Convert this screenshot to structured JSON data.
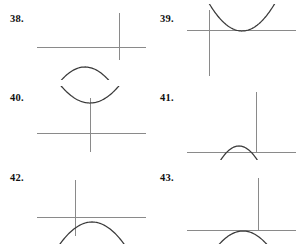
{
  "page": {
    "kind": "exercise-set",
    "width": 300,
    "height": 246,
    "background_color": "#ffffff",
    "axis_color": "#8a8a8a",
    "curve_color": "#3a3a3a",
    "label_color": "#111111"
  },
  "problems": [
    {
      "label": "38.",
      "label_x": 10,
      "label_y": 13,
      "panel_x": 33,
      "panel_y": 4,
      "panel_w": 115,
      "panel_h": 76,
      "axes": {
        "h_axis": {
          "x1": 4,
          "y": 43,
          "x2": 113
        },
        "v_axis": {
          "x": 86,
          "y1": 9,
          "y2": 56
        }
      },
      "curve": {
        "orientation": "opens-up",
        "vertex_x": 52,
        "vertex_y": 63,
        "a": 0.0235,
        "x_start": 8,
        "x_end": 110,
        "vertex_relative_to_origin": "below-and-left"
      }
    },
    {
      "label": "39.",
      "label_x": 160,
      "label_y": 13,
      "panel_x": 183,
      "panel_y": 4,
      "panel_w": 115,
      "panel_h": 76,
      "axes": {
        "h_axis": {
          "x1": 4,
          "y": 26,
          "x2": 113
        },
        "v_axis": {
          "x": 26,
          "y1": 6,
          "y2": 72
        }
      },
      "curve": {
        "orientation": "opens-down",
        "vertex_x": 59,
        "vertex_y": 27,
        "a": -0.0255,
        "x_start": 23,
        "x_end": 96,
        "vertex_relative_to_origin": "on-axis-right"
      }
    },
    {
      "label": "40.",
      "label_x": 10,
      "label_y": 92,
      "panel_x": 33,
      "panel_y": 86,
      "panel_w": 115,
      "panel_h": 74,
      "axes": {
        "h_axis": {
          "x1": 4,
          "y": 47,
          "x2": 113
        },
        "v_axis": {
          "x": 57,
          "y1": 12,
          "y2": 66
        }
      },
      "curve": {
        "orientation": "opens-down",
        "vertex_x": 57,
        "vertex_y": 17,
        "a": -0.0205,
        "x_start": 19,
        "x_end": 96,
        "vertex_relative_to_origin": "above-on-axis"
      }
    },
    {
      "label": "41.",
      "label_x": 160,
      "label_y": 92,
      "panel_x": 183,
      "panel_y": 86,
      "panel_w": 115,
      "panel_h": 74,
      "axes": {
        "h_axis": {
          "x1": 4,
          "y": 66,
          "x2": 113
        },
        "v_axis": {
          "x": 73,
          "y1": 6,
          "y2": 66
        }
      },
      "curve": {
        "orientation": "opens-up",
        "vertex_x": 56,
        "vertex_y": 60,
        "a": 0.042,
        "x_start": 22,
        "x_end": 90,
        "vertex_relative_to_origin": "above-axis-left"
      }
    },
    {
      "label": "42.",
      "label_x": 10,
      "label_y": 172,
      "panel_x": 33,
      "panel_y": 166,
      "panel_w": 115,
      "panel_h": 78,
      "axes": {
        "h_axis": {
          "x1": 4,
          "y": 51,
          "x2": 113
        },
        "v_axis": {
          "x": 42,
          "y1": 14,
          "y2": 70
        }
      },
      "curve": {
        "orientation": "opens-up",
        "vertex_x": 59,
        "vertex_y": 56,
        "a": 0.0215,
        "x_start": 8,
        "x_end": 110,
        "vertex_relative_to_origin": "below-and-right"
      }
    },
    {
      "label": "43.",
      "label_x": 160,
      "label_y": 172,
      "panel_x": 183,
      "panel_y": 166,
      "panel_w": 115,
      "panel_h": 78,
      "axes": {
        "h_axis": {
          "x1": 4,
          "y": 64,
          "x2": 113
        },
        "v_axis": {
          "x": 75,
          "y1": 12,
          "y2": 64
        }
      },
      "curve": {
        "orientation": "opens-up",
        "vertex_x": 60,
        "vertex_y": 65,
        "a": 0.0235,
        "x_start": 9,
        "x_end": 110,
        "vertex_relative_to_origin": "on-axis-left"
      }
    }
  ]
}
